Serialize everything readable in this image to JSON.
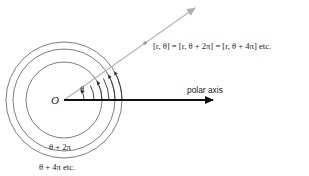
{
  "diagram": {
    "origin_label": "O",
    "angle_label": "θ",
    "equation": "[r, θ] = [r, θ + 2π] = [r, θ + 4π] etc.",
    "polar_axis_label": "polar axis",
    "loop_label_1": "θ + 2π",
    "loop_label_2": "θ + 4π etc.",
    "colors": {
      "axis": "#111111",
      "ray": "#b5b5b5",
      "circles": "#6e6e6e",
      "text": "#222222"
    }
  }
}
